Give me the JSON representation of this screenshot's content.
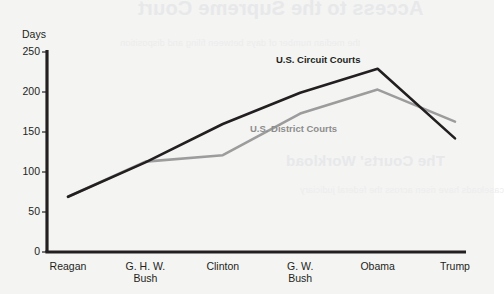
{
  "ghost_text": {
    "title": "Access to the Supreme Court",
    "subtitle": "The Courts' Workload",
    "body_line_1": "the median number of days between filing and disposition",
    "body_line_2": "caseloads have risen across the federal judiciary"
  },
  "chart_data": {
    "type": "line",
    "title": "",
    "xlabel": "",
    "ylabel": "Days",
    "ylim": [
      0,
      250
    ],
    "ytick_values": [
      0,
      50,
      100,
      150,
      200,
      250
    ],
    "ytick_labels": [
      "0",
      "50",
      "100",
      "150",
      "200",
      "250"
    ],
    "grid": false,
    "legend_position": "inline-annotation",
    "categories": [
      "Reagan",
      "G. H. W. Bush",
      "Clinton",
      "G. W. Bush",
      "Obama",
      "Trump"
    ],
    "category_lines": [
      [
        "Reagan"
      ],
      [
        "G. H. W.",
        "Bush"
      ],
      [
        "Clinton"
      ],
      [
        "G. W.",
        "Bush"
      ],
      [
        "Obama"
      ],
      [
        "Trump"
      ]
    ],
    "series": [
      {
        "name": "U.S. Circuit Courts",
        "color": "#231f20",
        "values": [
          69,
          112,
          160,
          199,
          229,
          142
        ]
      },
      {
        "name": "U.S. District Courts",
        "color": "#9c9c9c",
        "values": [
          69,
          113,
          121,
          173,
          203,
          163
        ]
      }
    ],
    "annotations": [
      {
        "text": "U.S. Circuit Courts",
        "series": "U.S. Circuit Courts"
      },
      {
        "text": "U.S. District Courts",
        "series": "U.S. District Courts"
      }
    ],
    "axis_color": "#231f20",
    "background_color": "#f4f4f3"
  }
}
